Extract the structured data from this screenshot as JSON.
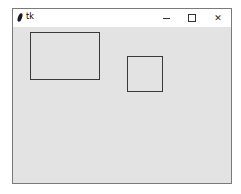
{
  "window": {
    "title": "tk",
    "app_icon": "tk-feather-icon",
    "controls": {
      "minimize": "minimize-icon",
      "maximize": "maximize-icon",
      "close_label": "✕"
    }
  },
  "canvas": {
    "background": "#e3e3e3",
    "shapes": [
      {
        "type": "rectangle",
        "outline": "#3a3a3a",
        "x1": 30,
        "y1": 32,
        "x2": 99,
        "y2": 79
      },
      {
        "type": "rectangle",
        "outline": "#3a3a3a",
        "x1": 127,
        "y1": 56,
        "x2": 162,
        "y2": 91
      }
    ]
  }
}
